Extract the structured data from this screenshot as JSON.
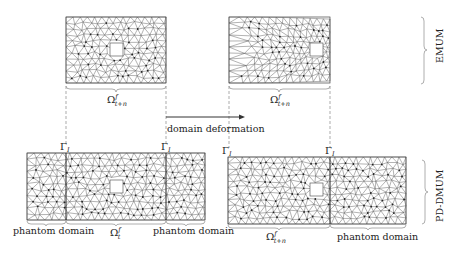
{
  "diagram": {
    "panels": {
      "top_left": {
        "name": "emum-reference-mesh"
      },
      "top_right": {
        "name": "emum-deformed-mesh"
      },
      "bottom_left": {
        "name": "pd-dmum-reference-mesh"
      },
      "bottom_right": {
        "name": "pd-dmum-deformed-mesh"
      }
    },
    "labels": {
      "omega_top_left": {
        "base": "Ω",
        "sup": "f",
        "sub": "t+n"
      },
      "omega_top_right": {
        "base": "Ω",
        "sup": "f",
        "sub": "t+n"
      },
      "omega_bottom_left": {
        "base": "Ω",
        "sup": "f",
        "sub": "t"
      },
      "omega_bottom_right": {
        "base": "Ω",
        "sup": "f",
        "sub": "t+n"
      },
      "gamma": {
        "base": "Γ",
        "sub": "I"
      },
      "domain_deformation": "domain deformation",
      "phantom_domain": "phantom domain",
      "emum": "EMUM",
      "pd_dmum": "PD-DMUM"
    },
    "colors": {
      "mesh": "#555555",
      "node": "#222222",
      "dashed": "#888888",
      "text": "#222222",
      "brace": "#999999"
    }
  }
}
